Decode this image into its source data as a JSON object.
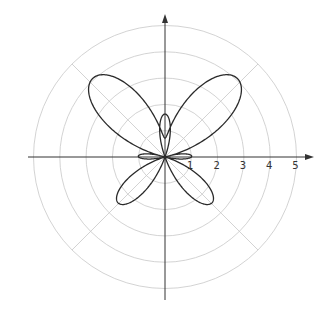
{
  "chart_data": {
    "type": "line",
    "subtype": "polar",
    "title": "",
    "equation": "r = e^(sin θ) − 2cos(4θ)",
    "theta_range": [
      0,
      6.2832
    ],
    "radial_ticks": [
      "1",
      "2",
      "3",
      "4",
      "5"
    ],
    "radial_grid": [
      1,
      2,
      3,
      4,
      5
    ],
    "angular_grid_deg": [
      0,
      45,
      90,
      135,
      180,
      225,
      270,
      315
    ],
    "rmax": 5,
    "grid": true,
    "legend": null,
    "series": [
      {
        "name": "butterfly curve",
        "color": "#2a2a2a"
      }
    ],
    "sample_points": [
      {
        "theta_deg": 0,
        "r": -1.0
      },
      {
        "theta_deg": 45,
        "r": 4.03
      },
      {
        "theta_deg": 90,
        "r": 0.72
      },
      {
        "theta_deg": 135,
        "r": 4.03
      },
      {
        "theta_deg": 180,
        "r": -1.0
      },
      {
        "theta_deg": 225,
        "r": 2.49
      },
      {
        "theta_deg": 270,
        "r": -1.63
      },
      {
        "theta_deg": 315,
        "r": 2.49
      }
    ]
  },
  "colors": {
    "grid": "#c8c8c8",
    "axis": "#333333",
    "curve": "#2a2a2a"
  }
}
